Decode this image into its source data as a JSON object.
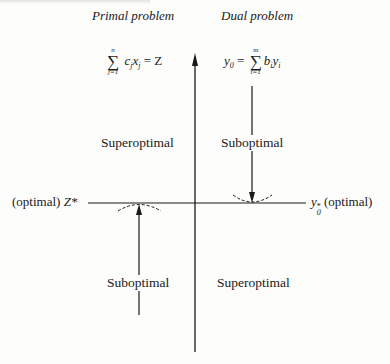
{
  "headers": {
    "primal": "Primal problem",
    "dual": "Dual problem"
  },
  "equations": {
    "primal": {
      "sum_upper": "n",
      "sum_lower": "j=1",
      "body": "c",
      "body_sub": "j",
      "var": "x",
      "var_sub": "j",
      "rhs": "= Z"
    },
    "dual": {
      "lhs": "y",
      "lhs_sub": "0",
      "eq": "=",
      "sum_upper": "m",
      "sum_lower": "i=1",
      "body": "b",
      "body_sub": "i",
      "var": "y",
      "var_sub": "i"
    }
  },
  "regions": {
    "top_left": "Superoptimal",
    "top_right": "Suboptimal",
    "bottom_left": "Suboptimal",
    "bottom_right": "Superoptimal"
  },
  "axis_labels": {
    "left_prefix": "(optimal)",
    "left_symbol": "Z*",
    "right_symbol": "y",
    "right_sub": "0",
    "right_sup": "*",
    "right_suffix": "(optimal)"
  },
  "colors": {
    "ink": "#1a1a1a",
    "paper": "#fdfdfb"
  }
}
